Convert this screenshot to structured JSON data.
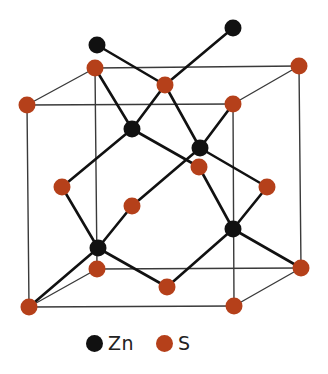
{
  "colors": {
    "zn": "#111111",
    "s": "#b5401a",
    "bond": "#111111",
    "cube_edge": "#3a3a3a"
  },
  "legend": [
    {
      "symbol": "Zn",
      "color": "#111111"
    },
    {
      "symbol": "S",
      "color": "#b5401a"
    }
  ],
  "cube": {
    "front": [
      [
        27,
        105
      ],
      [
        233,
        104
      ],
      [
        234,
        306
      ],
      [
        29,
        307
      ]
    ],
    "back": [
      [
        95,
        68
      ],
      [
        299,
        66
      ],
      [
        301,
        268
      ],
      [
        97,
        269
      ]
    ]
  },
  "atoms": {
    "S": [
      {
        "id": "front-tl",
        "x": 27,
        "y": 105
      },
      {
        "id": "front-tr",
        "x": 233,
        "y": 104
      },
      {
        "id": "front-bl",
        "x": 29,
        "y": 307
      },
      {
        "id": "front-br",
        "x": 234,
        "y": 306
      },
      {
        "id": "back-tl",
        "x": 95,
        "y": 68
      },
      {
        "id": "back-tr",
        "x": 299,
        "y": 66
      },
      {
        "id": "back-bl",
        "x": 97,
        "y": 269
      },
      {
        "id": "back-br",
        "x": 301,
        "y": 268
      },
      {
        "id": "face-top",
        "x": 165,
        "y": 85
      },
      {
        "id": "face-front",
        "x": 132,
        "y": 206
      },
      {
        "id": "face-right",
        "x": 267,
        "y": 187
      },
      {
        "id": "face-left",
        "x": 62,
        "y": 187
      },
      {
        "id": "face-bottom",
        "x": 167,
        "y": 287
      },
      {
        "id": "face-back",
        "x": 199,
        "y": 167
      }
    ],
    "Zn": [
      {
        "id": "zn-1",
        "x": 132,
        "y": 129
      },
      {
        "id": "zn-2",
        "x": 200,
        "y": 148
      },
      {
        "id": "zn-3",
        "x": 98,
        "y": 248
      },
      {
        "id": "zn-4",
        "x": 233,
        "y": 229
      },
      {
        "id": "zn-ext-1",
        "x": 97,
        "y": 45
      },
      {
        "id": "zn-ext-2",
        "x": 233,
        "y": 28
      }
    ]
  },
  "bonds": [
    [
      132,
      129,
      95,
      68
    ],
    [
      132,
      129,
      165,
      85
    ],
    [
      132,
      129,
      62,
      187
    ],
    [
      132,
      129,
      199,
      167
    ],
    [
      200,
      148,
      165,
      85
    ],
    [
      200,
      148,
      233,
      104
    ],
    [
      200,
      148,
      267,
      187
    ],
    [
      200,
      148,
      132,
      206
    ],
    [
      98,
      248,
      62,
      187
    ],
    [
      98,
      248,
      132,
      206
    ],
    [
      98,
      248,
      29,
      307
    ],
    [
      98,
      248,
      167,
      287
    ],
    [
      233,
      229,
      199,
      167
    ],
    [
      233,
      229,
      267,
      187
    ],
    [
      233,
      229,
      301,
      268
    ],
    [
      233,
      229,
      167,
      287
    ],
    [
      97,
      45,
      165,
      85
    ],
    [
      233,
      28,
      165,
      85
    ]
  ]
}
